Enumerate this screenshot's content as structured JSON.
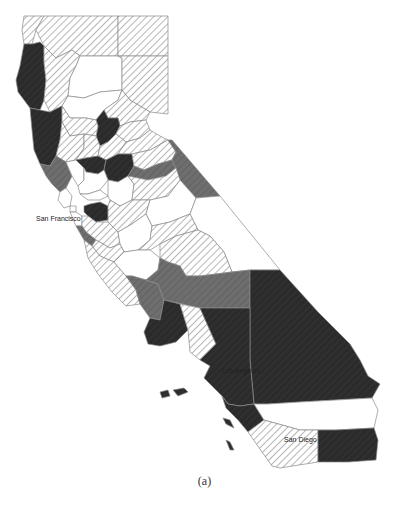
{
  "figure": {
    "caption": "(a)",
    "categories": [
      {
        "key": "white",
        "fill": "#ffffff",
        "pattern": "none"
      },
      {
        "key": "hatch",
        "fill": "#ffffff",
        "pattern": "diagonal hatch (light)"
      },
      {
        "key": "medium",
        "fill": "#6e6e6e",
        "pattern": "diagonal hatch (medium gray)"
      },
      {
        "key": "dark",
        "fill": "#2b2b2b",
        "pattern": "solid dark"
      }
    ],
    "colors": {
      "border": "#8a8a8a",
      "hatch_line": "#7a7a7a",
      "medium": "#6e6e6e",
      "dark": "#2b2b2b"
    }
  },
  "labels": {
    "san_francisco": "San Francisco",
    "los_angeles": "Los Angeles",
    "san_diego": "San Diego"
  }
}
